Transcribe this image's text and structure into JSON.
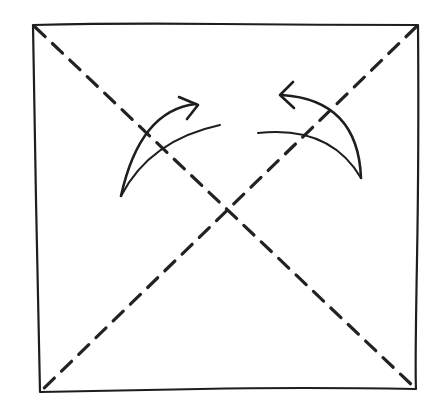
{
  "diagram": {
    "colors": {
      "ink": "#1e1e1e",
      "background": "#ffffff"
    },
    "square": {
      "top_left": [
        33,
        25
      ],
      "top_right": [
        418,
        25
      ],
      "bottom_right": [
        416,
        389
      ],
      "bottom_left": [
        40,
        392
      ]
    },
    "fold_lines": [
      {
        "name": "diagonal-tl-br",
        "style": "dashed",
        "from": [
          33,
          25
        ],
        "to": [
          416,
          389
        ]
      },
      {
        "name": "diagonal-tr-bl",
        "style": "dashed",
        "from": [
          418,
          25
        ],
        "to": [
          40,
          392
        ]
      }
    ],
    "arrows": [
      {
        "name": "left-fold-arrow",
        "direction": "up-right",
        "tip": [
          198,
          105
        ]
      },
      {
        "name": "right-fold-arrow",
        "direction": "up-left",
        "tip": [
          280,
          94
        ]
      }
    ]
  }
}
